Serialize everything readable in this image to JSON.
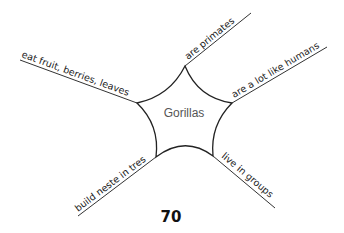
{
  "diagram": {
    "type": "web-organizer",
    "center": {
      "label": "Gorillas"
    },
    "branches": [
      {
        "label": "are primates"
      },
      {
        "label": "are a lot like humans"
      },
      {
        "label": "live in groups"
      },
      {
        "label": "build neste in tres"
      },
      {
        "label": "eat fruit, berries, leaves"
      }
    ]
  },
  "page": {
    "number": "70"
  }
}
